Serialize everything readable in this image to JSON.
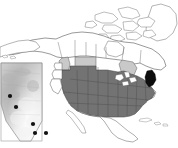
{
  "figure": {
    "background_color": "#ffffff",
    "width": 178,
    "height": 148
  },
  "colors": {
    "background": "#ffffff",
    "land_unshaded": "#ffffff",
    "border_line": "#4d4d4d",
    "coast_line": "#666666",
    "us_states_fill": "#737373",
    "us_states_stroke": "#4a4a4a",
    "province_light_fill": "#c9c9c9",
    "highlight_black": "#0d0d0d",
    "inset_frame": "#8c8c8c",
    "inset_fill_light": "#e8e8e8",
    "inset_fill_mid": "#c4c4c4",
    "inset_fill_dark": "#a8a8a8",
    "marker_fill": "#111111"
  },
  "base_map": {
    "name": "north-america",
    "projection_note": "lambert-conformal-conic",
    "regions": [
      {
        "id": "canada",
        "label": "Canada",
        "fill": "#ffffff"
      },
      {
        "id": "greenland",
        "label": "Greenland",
        "fill": "#ffffff"
      },
      {
        "id": "mexico",
        "label": "Mexico",
        "fill": "#ffffff"
      },
      {
        "id": "alaska",
        "label": "Alaska",
        "fill": "#ffffff"
      }
    ],
    "shaded_provinces": [
      {
        "id": "british-columbia",
        "label": "British Columbia",
        "shade": "light"
      },
      {
        "id": "saskatchewan",
        "label": "Saskatchewan",
        "shade": "light"
      },
      {
        "id": "manitoba",
        "label": "Manitoba",
        "shade": "light"
      },
      {
        "id": "ontario",
        "label": "Ontario",
        "shade": "light"
      }
    ],
    "shaded_states": {
      "shade": "dark",
      "label": "Contiguous United States",
      "count": 46
    },
    "highlight_region": {
      "id": "northeast-highlight",
      "label": "Vermont / New Hampshire",
      "shade": "black"
    }
  },
  "inset": {
    "name": "nevada-inset",
    "label": "Nevada",
    "frame": true,
    "markers": [
      {
        "id": "site-1",
        "x": 10,
        "y": 96,
        "label": "Site 1"
      },
      {
        "id": "site-2",
        "x": 16,
        "y": 107,
        "label": "Site 2"
      },
      {
        "id": "site-3",
        "x": 33,
        "y": 124,
        "label": "Site 3"
      },
      {
        "id": "site-4",
        "x": 35,
        "y": 133,
        "label": "Site 4"
      },
      {
        "id": "site-5",
        "x": 46,
        "y": 133,
        "label": "Site 5"
      }
    ],
    "marker_radius": 2.1
  }
}
